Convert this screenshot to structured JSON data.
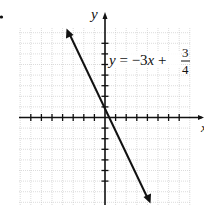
{
  "problem_marker": ".",
  "chart_data": {
    "type": "line",
    "title": "",
    "xlabel": "x",
    "ylabel": "y",
    "equation": {
      "prefix": "y = −3x + ",
      "numerator": "3",
      "denominator": "4"
    },
    "series": [
      {
        "name": "y = -3x + 3/4",
        "slope": -3,
        "intercept": 0.75,
        "arrows": "both"
      }
    ],
    "xlim": [
      -8,
      8
    ],
    "ylim": [
      -8,
      8.5
    ],
    "grid": true,
    "x_ticks": [
      -7,
      -6,
      -5,
      -4,
      -3,
      -2,
      -1,
      1,
      2,
      3,
      4,
      5,
      6,
      7
    ],
    "y_ticks": [
      -6,
      -5,
      -4,
      -3,
      -2,
      -1,
      1,
      2,
      3,
      4,
      5,
      6,
      7
    ],
    "tick_labels_shown": false,
    "colors": {
      "line": "#111111",
      "grid": "#c8c8c8",
      "axis": "#111111"
    }
  }
}
